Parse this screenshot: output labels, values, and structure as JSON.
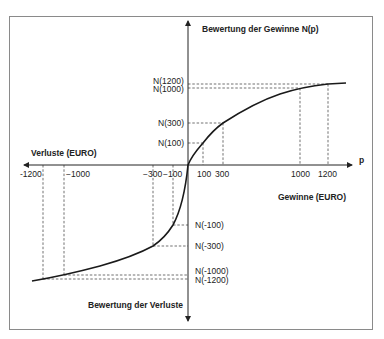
{
  "diagram": {
    "title_gains_axis": "Bewertung der Gewinne N(p)",
    "title_losses_axis": "Bewertung der Verluste",
    "x_axis_label": "p",
    "left_label": "Verluste (EURO)",
    "right_label": "Gewinne (EURO)",
    "x_ticks": {
      "neg1200": "-1200",
      "neg1000": "−1000",
      "neg300": "−300",
      "neg100": "−100",
      "pos100": "100",
      "pos300": "300",
      "pos1000": "1000",
      "pos1200": "1200"
    },
    "y_labels": {
      "n1200": "N(1200)",
      "n1000": "N(1000)",
      "n300": "N(300)",
      "n100": "N(100)",
      "nm100": "N(-100)",
      "nm300": "N(-300)",
      "nm1000": "N(-1000)",
      "nm1200": "N(-1200)"
    },
    "curve_description": "S-shaped value function: concave for gains, convex and steeper for losses"
  }
}
